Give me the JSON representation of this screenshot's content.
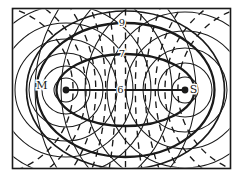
{
  "diagram": {
    "ink_color": "#1a1a1a",
    "background_color": "#ffffff",
    "labels": {
      "left_focus": "M",
      "right_focus": "S",
      "contour_outer": "9",
      "contour_middle": "7",
      "focal_segment": "6"
    }
  }
}
